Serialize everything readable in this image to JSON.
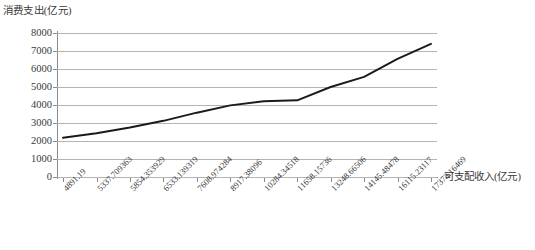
{
  "chart_data": {
    "type": "line",
    "title": "",
    "ylabel": "消费支出(亿元)",
    "xlabel": "可支配收入(亿元)",
    "ylim": [
      0,
      8000
    ],
    "y_ticks": [
      "0",
      "1000",
      "2000",
      "3000",
      "4000",
      "5000",
      "6000",
      "7000",
      "8000"
    ],
    "y_tick_values": [
      0,
      1000,
      2000,
      3000,
      4000,
      5000,
      6000,
      7000,
      8000
    ],
    "grid": true,
    "legend": "none",
    "categories": [
      "4891.19",
      "5337.709363",
      "5854.353929",
      "6533.139319",
      "7608.974284",
      "8917.38096",
      "10284.34518",
      "11658.15736",
      "13248.66506",
      "14145.48478",
      "16115.23117",
      "17373.16469"
    ],
    "x_values": [
      4891.19,
      5337.709363,
      5854.353929,
      6533.139319,
      7608.974284,
      8917.38096,
      10284.34518,
      11658.15736,
      13248.66506,
      14145.48478,
      16115.23117,
      17373.16469
    ],
    "series": [
      {
        "name": "消费支出",
        "color": "#1a1a1a",
        "values": [
          2180,
          2430,
          2750,
          3120,
          3570,
          3980,
          4210,
          4260,
          5000,
          5560,
          6560,
          7400
        ]
      }
    ]
  },
  "axes": {
    "y_axis_color": "#8a8a8a",
    "gridline_color": "#b4b4b4",
    "tick_label_color": "#3a3a3a"
  }
}
